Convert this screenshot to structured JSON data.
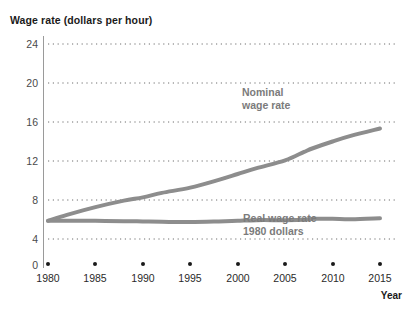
{
  "chart_data": {
    "type": "line",
    "title": "Wage rate (dollars per hour)",
    "xlabel": "Year",
    "ylabel": "Wage rate (dollars per hour)",
    "xlim": [
      1980,
      2015
    ],
    "ylim": [
      0,
      24
    ],
    "grid": true,
    "grid_style": "dotted-horizontal",
    "legend_position": "inline-annotation",
    "yticks": [
      0,
      4,
      8,
      12,
      16,
      20,
      24
    ],
    "ytick_labels": [
      "0",
      "4",
      "8",
      "12",
      "16",
      "20",
      "24"
    ],
    "xticks": [
      1980,
      1985,
      1990,
      1995,
      2000,
      2005,
      2010,
      2015
    ],
    "xtick_labels": [
      "1980",
      "1985",
      "1990",
      "1995",
      "2000",
      "2005",
      "2010",
      "2015"
    ],
    "line_color": "#8d8d8d",
    "series": [
      {
        "name": "Nominal wage rate",
        "label_lines": [
          "Nominal",
          "wage rate"
        ],
        "x": [
          1980,
          1982,
          1985,
          1988,
          1990,
          1992,
          1995,
          1998,
          2000,
          2002,
          2005,
          2007,
          2008,
          2010,
          2012,
          2015
        ],
        "values": [
          6.8,
          7.7,
          8.9,
          9.9,
          10.4,
          11.1,
          11.9,
          13.1,
          14.0,
          14.9,
          16.1,
          17.4,
          18.0,
          19.0,
          19.9,
          21.0
        ]
      },
      {
        "name": "Real wage rate 1980 dollars",
        "label_lines": [
          "Real wage rate",
          "1980 dollars"
        ],
        "x": [
          1980,
          1982,
          1985,
          1988,
          1990,
          1992,
          1995,
          1998,
          2000,
          2002,
          2005,
          2007,
          2008,
          2010,
          2012,
          2015
        ],
        "values": [
          6.8,
          6.8,
          6.8,
          6.75,
          6.7,
          6.65,
          6.6,
          6.7,
          6.8,
          6.9,
          6.9,
          6.95,
          7.1,
          7.1,
          7.05,
          7.2
        ]
      }
    ]
  }
}
